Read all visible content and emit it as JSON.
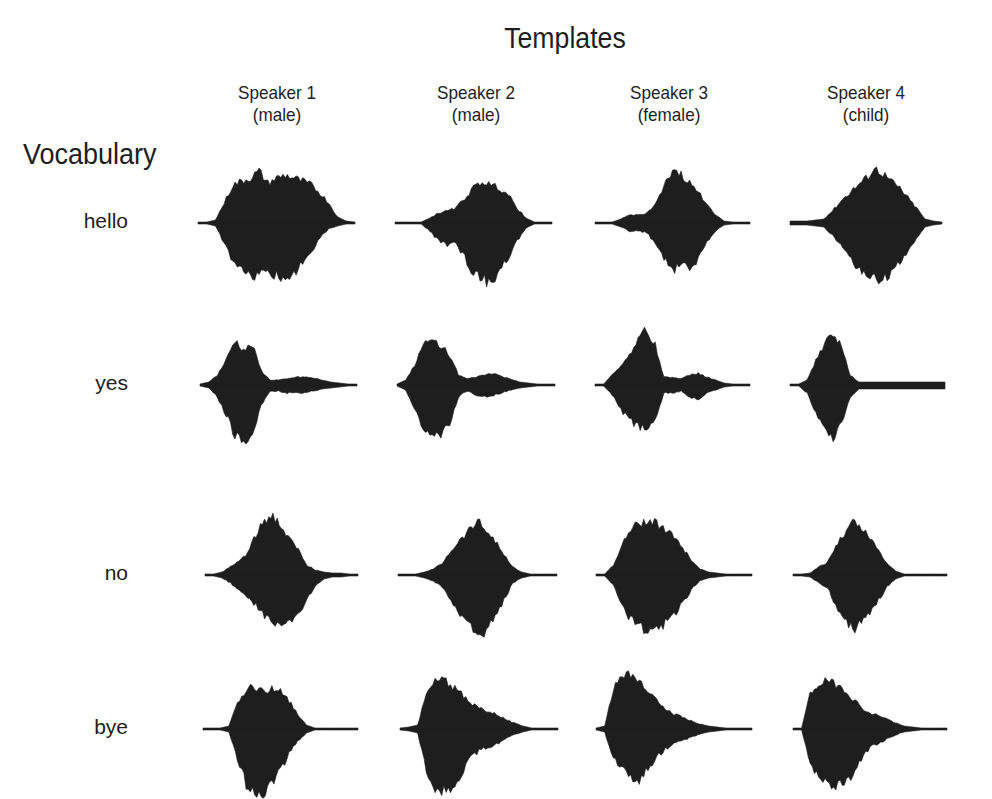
{
  "figure": {
    "title": "Templates",
    "vocabulary_title": "Vocabulary",
    "ink_color": "#1e1e1e",
    "background": "#ffffff"
  },
  "columns": [
    {
      "line1": "Speaker 1",
      "line2": "(male)",
      "center_x": 277
    },
    {
      "line1": "Speaker 2",
      "line2": "(male)",
      "center_x": 476
    },
    {
      "line1": "Speaker 3",
      "line2": "(female)",
      "center_x": 669
    },
    {
      "line1": "Speaker 4",
      "line2": "(child)",
      "center_x": 866
    }
  ],
  "rows": [
    {
      "label": "hello",
      "baseline_y": 223
    },
    {
      "label": "yes",
      "baseline_y": 385
    },
    {
      "label": "no",
      "baseline_y": 575
    },
    {
      "label": "bye",
      "baseline_y": 729
    }
  ],
  "waveforms": [
    [
      {
        "x0": 198,
        "x1": 355,
        "top": [
          1,
          1,
          3,
          20,
          38,
          42,
          45,
          52,
          40,
          45,
          48,
          45,
          42,
          38,
          30,
          20,
          6,
          2,
          1
        ],
        "bot": [
          1,
          1,
          3,
          20,
          40,
          48,
          55,
          52,
          50,
          52,
          58,
          50,
          40,
          30,
          15,
          6,
          3,
          1,
          1
        ]
      },
      {
        "x0": 395,
        "x1": 552,
        "top": [
          1,
          1,
          1,
          1,
          5,
          10,
          12,
          15,
          25,
          35,
          42,
          38,
          35,
          28,
          15,
          5,
          1,
          1,
          1
        ],
        "bot": [
          1,
          1,
          1,
          1,
          8,
          18,
          22,
          20,
          35,
          50,
          55,
          62,
          48,
          35,
          18,
          5,
          1,
          1,
          1
        ]
      },
      {
        "x0": 595,
        "x1": 750,
        "top": [
          1,
          1,
          1,
          4,
          8,
          8,
          10,
          18,
          35,
          55,
          48,
          40,
          30,
          20,
          8,
          2,
          1,
          1,
          1
        ],
        "bot": [
          1,
          1,
          1,
          4,
          8,
          8,
          10,
          20,
          35,
          50,
          38,
          48,
          35,
          20,
          8,
          2,
          1,
          1,
          1
        ]
      },
      {
        "x0": 790,
        "x1": 942,
        "top": [
          2,
          2,
          2,
          3,
          4,
          12,
          22,
          30,
          38,
          45,
          55,
          50,
          42,
          35,
          25,
          15,
          4,
          2,
          1
        ],
        "bot": [
          2,
          2,
          2,
          3,
          4,
          12,
          22,
          35,
          45,
          52,
          55,
          58,
          50,
          40,
          30,
          15,
          4,
          2,
          1
        ]
      }
    ],
    [
      {
        "x0": 200,
        "x1": 357,
        "top": [
          1,
          3,
          10,
          25,
          45,
          35,
          40,
          15,
          5,
          5,
          6,
          8,
          8,
          7,
          5,
          3,
          2,
          1,
          1
        ],
        "bot": [
          1,
          3,
          12,
          30,
          50,
          60,
          55,
          20,
          6,
          6,
          8,
          8,
          8,
          6,
          4,
          3,
          2,
          1,
          1
        ]
      },
      {
        "x0": 397,
        "x1": 555,
        "top": [
          1,
          5,
          20,
          40,
          45,
          40,
          30,
          10,
          6,
          8,
          10,
          12,
          8,
          6,
          3,
          2,
          1,
          1,
          1
        ],
        "bot": [
          1,
          5,
          25,
          45,
          55,
          50,
          40,
          12,
          6,
          10,
          12,
          10,
          8,
          5,
          3,
          2,
          1,
          1,
          1
        ]
      },
      {
        "x0": 595,
        "x1": 750,
        "top": [
          1,
          1,
          10,
          20,
          30,
          48,
          55,
          40,
          8,
          8,
          6,
          10,
          12,
          8,
          5,
          2,
          1,
          1,
          1
        ],
        "bot": [
          1,
          1,
          10,
          25,
          35,
          42,
          45,
          35,
          8,
          8,
          6,
          12,
          14,
          8,
          5,
          2,
          1,
          1,
          1
        ]
      },
      {
        "x0": 790,
        "x1": 945,
        "top": [
          1,
          1,
          5,
          25,
          42,
          52,
          38,
          10,
          3,
          3,
          3,
          3,
          3,
          3,
          3,
          3,
          3,
          3,
          3
        ],
        "bot": [
          1,
          1,
          8,
          28,
          42,
          52,
          40,
          12,
          4,
          4,
          4,
          4,
          4,
          4,
          4,
          4,
          4,
          4,
          4
        ]
      }
    ],
    [
      {
        "x0": 205,
        "x1": 358,
        "top": [
          1,
          1,
          3,
          8,
          14,
          22,
          40,
          55,
          60,
          48,
          35,
          25,
          10,
          5,
          3,
          2,
          2,
          1,
          1
        ],
        "bot": [
          1,
          1,
          3,
          8,
          16,
          22,
          30,
          40,
          48,
          55,
          45,
          38,
          25,
          10,
          4,
          2,
          2,
          1,
          1
        ]
      },
      {
        "x0": 398,
        "x1": 557,
        "top": [
          1,
          1,
          1,
          3,
          6,
          12,
          25,
          35,
          45,
          55,
          45,
          35,
          20,
          8,
          3,
          1,
          1,
          1,
          1
        ],
        "bot": [
          1,
          1,
          1,
          3,
          6,
          12,
          25,
          38,
          50,
          62,
          58,
          42,
          25,
          8,
          3,
          1,
          1,
          1,
          1
        ]
      },
      {
        "x0": 596,
        "x1": 752,
        "top": [
          1,
          1,
          10,
          30,
          45,
          52,
          55,
          52,
          45,
          38,
          28,
          15,
          6,
          3,
          2,
          1,
          1,
          1,
          1
        ],
        "bot": [
          1,
          1,
          10,
          30,
          45,
          52,
          56,
          55,
          48,
          40,
          28,
          15,
          6,
          3,
          2,
          1,
          1,
          1,
          1
        ]
      },
      {
        "x0": 793,
        "x1": 947,
        "top": [
          1,
          1,
          2,
          8,
          12,
          30,
          42,
          55,
          48,
          38,
          25,
          12,
          4,
          1,
          1,
          1,
          1,
          1,
          1
        ],
        "bot": [
          1,
          1,
          2,
          8,
          12,
          30,
          45,
          55,
          48,
          38,
          25,
          12,
          4,
          1,
          1,
          1,
          1,
          1,
          1
        ]
      }
    ],
    [
      {
        "x0": 203,
        "x1": 358,
        "top": [
          1,
          1,
          1,
          3,
          25,
          40,
          42,
          38,
          40,
          40,
          28,
          15,
          4,
          1,
          1,
          1,
          1,
          1,
          1
        ],
        "bot": [
          1,
          1,
          1,
          3,
          30,
          55,
          62,
          65,
          55,
          42,
          25,
          12,
          4,
          1,
          1,
          1,
          1,
          1,
          1
        ]
      },
      {
        "x0": 400,
        "x1": 558,
        "top": [
          1,
          2,
          4,
          35,
          48,
          50,
          42,
          35,
          25,
          22,
          18,
          15,
          10,
          6,
          3,
          1,
          1,
          1,
          1
        ],
        "bot": [
          1,
          2,
          4,
          42,
          58,
          62,
          58,
          45,
          30,
          22,
          18,
          15,
          10,
          6,
          3,
          1,
          1,
          1,
          1
        ]
      },
      {
        "x0": 596,
        "x1": 752,
        "top": [
          1,
          3,
          40,
          52,
          55,
          48,
          40,
          28,
          20,
          15,
          12,
          8,
          5,
          3,
          2,
          1,
          1,
          1,
          1
        ],
        "bot": [
          1,
          3,
          30,
          40,
          50,
          52,
          40,
          28,
          20,
          15,
          12,
          8,
          5,
          3,
          2,
          1,
          1,
          1,
          1
        ]
      },
      {
        "x0": 793,
        "x1": 947,
        "top": [
          1,
          1,
          35,
          45,
          48,
          45,
          40,
          30,
          22,
          15,
          14,
          10,
          6,
          3,
          2,
          1,
          1,
          1,
          1
        ],
        "bot": [
          1,
          1,
          35,
          48,
          55,
          58,
          55,
          45,
          30,
          18,
          14,
          10,
          6,
          3,
          2,
          1,
          1,
          1,
          1
        ]
      }
    ]
  ]
}
